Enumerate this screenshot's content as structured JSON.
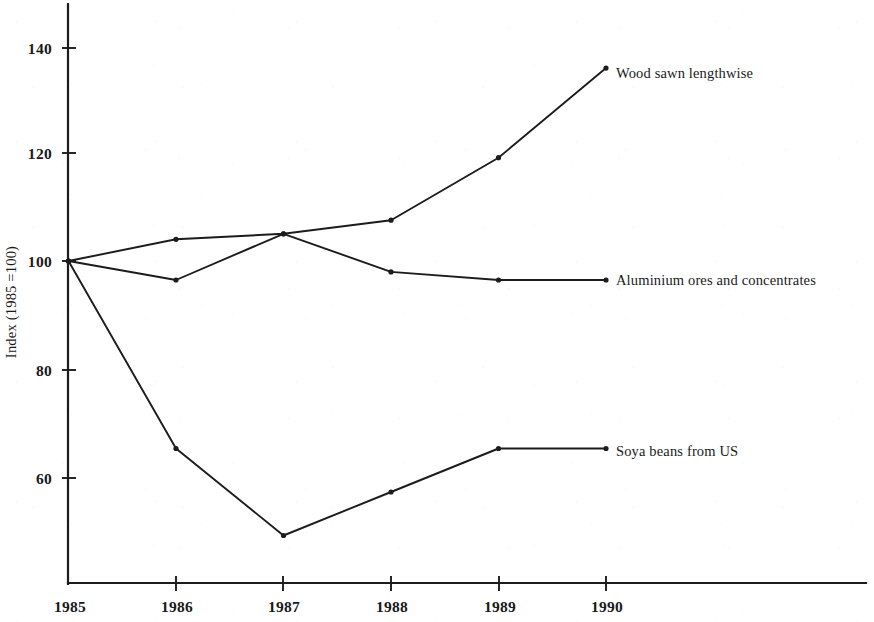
{
  "chart_data": {
    "type": "line",
    "title": "",
    "subtitle": "",
    "xlabel": "",
    "ylabel": "Index (1985 =100)",
    "x": [
      "1985",
      "1986",
      "1987",
      "1988",
      "1989",
      "1990"
    ],
    "categories": [
      "1985",
      "1986",
      "1987",
      "1988",
      "1989",
      "1990"
    ],
    "xtick_labels": [
      "1985",
      "1986",
      "1987",
      "1988",
      "1989",
      "1990"
    ],
    "ytick_labels": [
      "60",
      "80",
      "100",
      "120",
      "140"
    ],
    "ytick_values": [
      60,
      80,
      100,
      120,
      140
    ],
    "ylim": [
      42,
      145
    ],
    "xlim": [
      "1985",
      "1990"
    ],
    "grid": false,
    "legend_position": "inline-right-of-line-end",
    "marker": "dot",
    "line_color": "#1c1c1c",
    "series": [
      {
        "name": "Wood sawn lengthwise",
        "label": "Wood sawn lengthwise",
        "values": [
          100,
          104,
          105,
          107.5,
          119,
          135.5
        ]
      },
      {
        "name": "Aluminium ores and concentrates",
        "label": "Aluminium ores and concentrates",
        "values": [
          100,
          96.5,
          105,
          98,
          96.5,
          96.5
        ]
      },
      {
        "name": "Soya beans from US",
        "label": "Soya beans from US",
        "values": [
          100,
          65.5,
          49.5,
          57.5,
          65.5,
          65.5
        ]
      }
    ],
    "annotations": []
  },
  "axis": {
    "y_title": "Index (1985 =100)",
    "y_ticks": [
      "140",
      "120",
      "100",
      "80",
      "60"
    ],
    "x_ticks": [
      "1985",
      "1986",
      "1987",
      "1988",
      "1989",
      "1990"
    ]
  },
  "labels": {
    "wood": "Wood sawn lengthwise",
    "aluminium": "Aluminium ores and concentrates",
    "soya": "Soya beans from US"
  }
}
